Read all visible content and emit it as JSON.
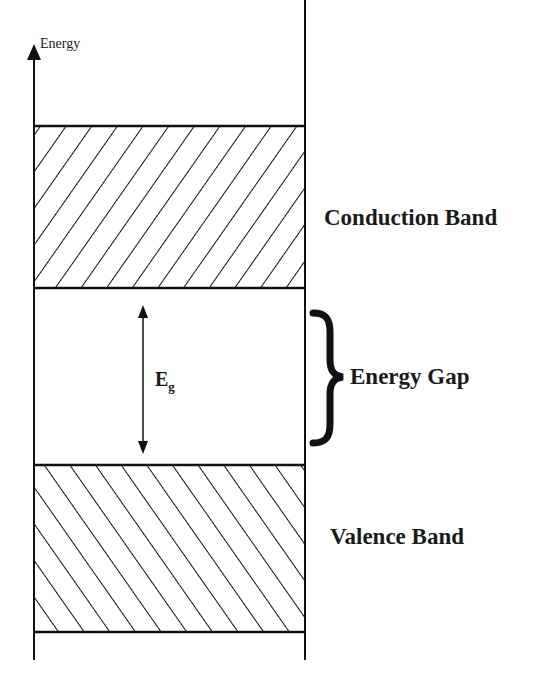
{
  "diagram": {
    "type": "energy-band-diagram",
    "axis": {
      "label": "Energy",
      "direction": "up"
    },
    "bands": [
      {
        "name": "Conduction Band",
        "hatch": "forward-diagonal",
        "position": "top"
      },
      {
        "name": "Valence Band",
        "hatch": "backward-diagonal",
        "position": "bottom"
      }
    ],
    "gap": {
      "label": "Energy Gap",
      "symbol": "E",
      "subscript": "g",
      "brace": "}"
    }
  }
}
